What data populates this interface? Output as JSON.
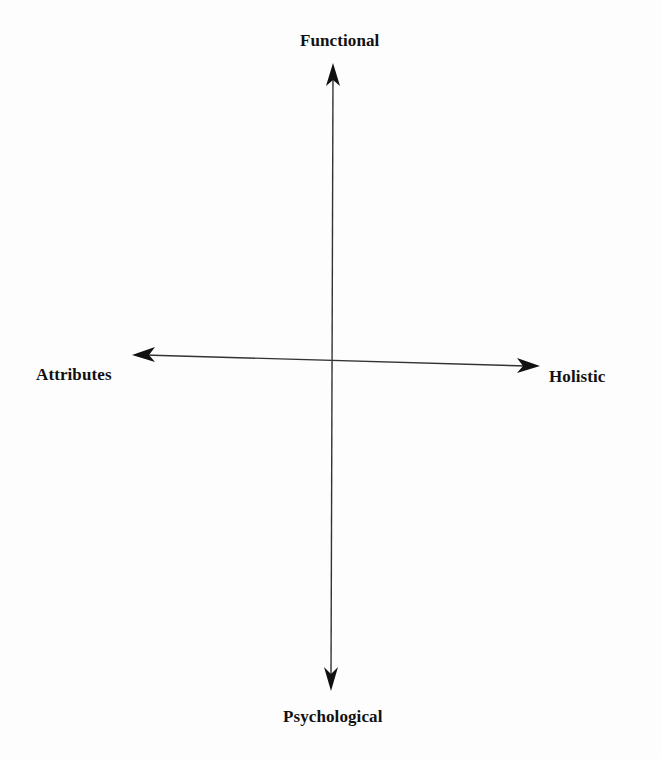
{
  "diagram": {
    "type": "two-axis perceptual map",
    "axes": {
      "vertical": {
        "top_label": "Functional",
        "bottom_label": "Psychological"
      },
      "horizontal": {
        "left_label": "Attributes",
        "right_label": "Holistic"
      }
    },
    "colors": {
      "line": "#222222",
      "text": "#111111",
      "background": "#fdfdfd"
    }
  }
}
